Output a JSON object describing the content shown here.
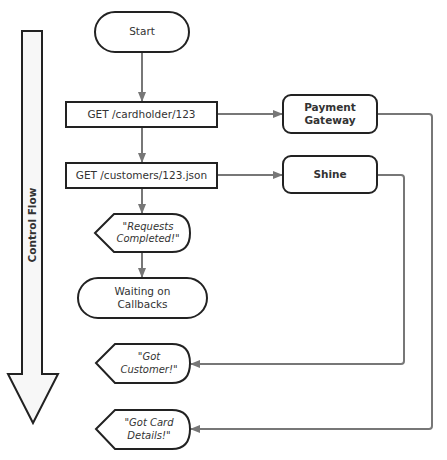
{
  "diagram": {
    "type": "flowchart",
    "colors": {
      "stroke": "#222222",
      "connector": "#777777",
      "flow_arrow_fill": "#f7f7f7",
      "text": "#333333"
    },
    "control_flow_arrow": {
      "label": "Control Flow",
      "direction": "down"
    },
    "nodes": {
      "start": {
        "label": "Start",
        "shape": "terminator"
      },
      "get_cardholder": {
        "label": "GET /cardholder/123",
        "shape": "process"
      },
      "get_customers": {
        "label": "GET /customers/123.json",
        "shape": "process"
      },
      "requests_completed": {
        "label": "\"Requests\nCompleted!\"",
        "shape": "display"
      },
      "waiting": {
        "label": "Waiting on\nCallbacks",
        "shape": "terminator"
      },
      "payment_gateway": {
        "label": "Payment\nGateway",
        "shape": "rounded-rect"
      },
      "shine": {
        "label": "Shine",
        "shape": "rounded-rect"
      },
      "got_customer": {
        "label": "\"Got\nCustomer!\"",
        "shape": "display"
      },
      "got_card_details": {
        "label": "\"Got Card\nDetails!\"",
        "shape": "display"
      }
    },
    "edges": [
      {
        "from": "start",
        "to": "get_cardholder"
      },
      {
        "from": "get_cardholder",
        "to": "get_customers"
      },
      {
        "from": "get_customers",
        "to": "requests_completed"
      },
      {
        "from": "requests_completed",
        "to": "waiting"
      },
      {
        "from": "get_cardholder",
        "to": "payment_gateway"
      },
      {
        "from": "get_customers",
        "to": "shine"
      },
      {
        "from": "shine",
        "to": "got_customer"
      },
      {
        "from": "payment_gateway",
        "to": "got_card_details"
      }
    ]
  }
}
